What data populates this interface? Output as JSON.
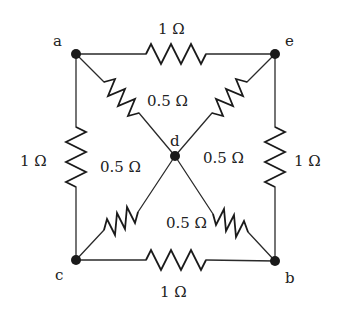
{
  "diagram": {
    "type": "resistor-network",
    "nodes": {
      "a": {
        "label": "a",
        "x": 76,
        "y": 54
      },
      "e": {
        "label": "e",
        "x": 275,
        "y": 54
      },
      "c": {
        "label": "c",
        "x": 76,
        "y": 260
      },
      "b": {
        "label": "b",
        "x": 275,
        "y": 261
      },
      "d": {
        "label": "d",
        "x": 175,
        "y": 156
      }
    },
    "resistors": [
      {
        "id": "R_ae",
        "from": "a",
        "to": "e",
        "value": "1 Ω"
      },
      {
        "id": "R_ac",
        "from": "a",
        "to": "c",
        "value": "1 Ω"
      },
      {
        "id": "R_eb",
        "from": "e",
        "to": "b",
        "value": "1 Ω"
      },
      {
        "id": "R_cb",
        "from": "c",
        "to": "b",
        "value": "1 Ω"
      },
      {
        "id": "R_ad",
        "from": "a",
        "to": "d",
        "value": "0.5 Ω"
      },
      {
        "id": "R_ed",
        "from": "e",
        "to": "d",
        "value": "0.5 Ω"
      },
      {
        "id": "R_cd",
        "from": "c",
        "to": "d",
        "value": "0.5 Ω"
      },
      {
        "id": "R_bd",
        "from": "b",
        "to": "d",
        "value": "0.5 Ω"
      }
    ],
    "labels": {
      "top": "1 Ω",
      "left": "1 Ω",
      "right": "1 Ω",
      "bottom": "1 Ω",
      "ad": "0.5 Ω",
      "ed": "0.5 Ω",
      "cd": "0.5 Ω",
      "bd": "0.5 Ω"
    },
    "colors": {
      "ink": "#1a1a1a",
      "background": "#ffffff"
    }
  }
}
